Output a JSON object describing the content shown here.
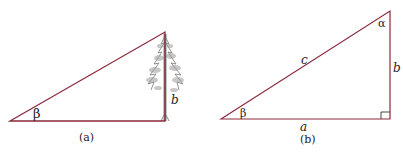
{
  "figure_a": {
    "caption": "(a)",
    "angle_label": "β",
    "side_label": "b",
    "object": "tree"
  },
  "figure_b": {
    "caption": "(b)",
    "angle_bottom_label": "β",
    "angle_top_label": "α",
    "hypotenuse_label": "c",
    "vertical_side_label": "b",
    "horizontal_side_label": "a"
  },
  "colors": {
    "line": "#8b2a3a",
    "text": "#222222",
    "tree": "#6a6a6a"
  }
}
